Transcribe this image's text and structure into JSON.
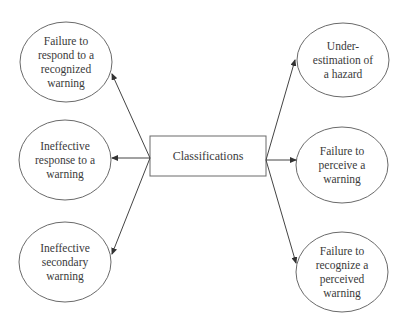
{
  "diagram": {
    "center": {
      "label": "Classifications",
      "box": {
        "x": 150,
        "y": 136,
        "w": 116,
        "h": 40
      }
    },
    "left_nodes": [
      {
        "label": "Failure to\nrespond to a\nrecognized\nwarning",
        "cx": 66,
        "cy": 62,
        "rx": 46,
        "ry": 40
      },
      {
        "label": "Ineffective\nresponse to a\nwarning",
        "cx": 65,
        "cy": 160,
        "rx": 46,
        "ry": 40
      },
      {
        "label": "Ineffective\nsecondary\nwarning",
        "cx": 65,
        "cy": 262,
        "rx": 46,
        "ry": 40
      }
    ],
    "right_nodes": [
      {
        "label": "Under-\nestimation of\na hazard",
        "cx": 343,
        "cy": 60,
        "rx": 46,
        "ry": 37
      },
      {
        "label": "Failure to\nperceive a\nwarning",
        "cx": 342,
        "cy": 165,
        "rx": 46,
        "ry": 38
      },
      {
        "label": "Failure to\nrecognize a\nperceived\nwarning",
        "cx": 342,
        "cy": 272,
        "rx": 46,
        "ry": 40
      }
    ],
    "colors": {
      "stroke": "#6a6a6a",
      "arrow": "#333333",
      "text": "#3a3a3a",
      "background": "#ffffff"
    }
  }
}
